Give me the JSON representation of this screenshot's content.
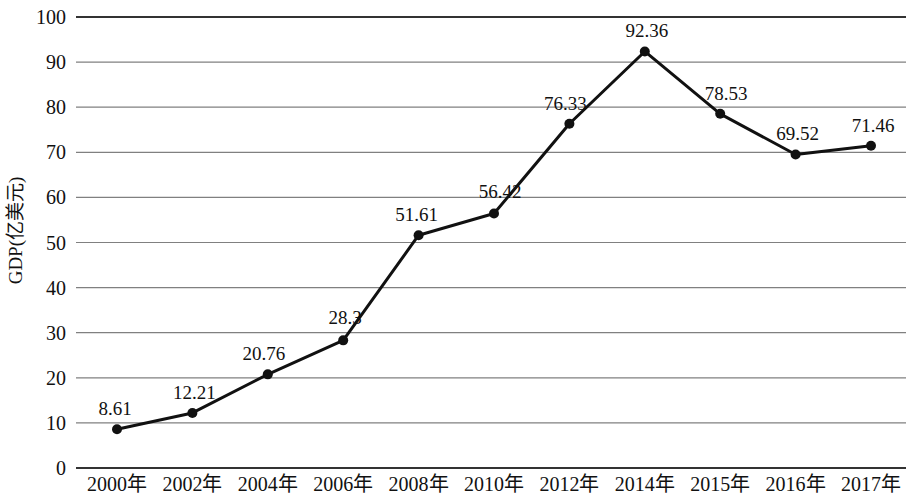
{
  "chart_data": {
    "type": "line",
    "title": "",
    "subtitle": "",
    "xlabel": "",
    "ylabel": "GDP(亿美元)",
    "categories": [
      "2000年",
      "2002年",
      "2004年",
      "2006年",
      "2008年",
      "2010年",
      "2012年",
      "2014年",
      "2015年",
      "2016年",
      "2017年"
    ],
    "values": [
      8.61,
      12.21,
      20.76,
      28.3,
      51.61,
      56.42,
      76.33,
      92.36,
      78.53,
      69.52,
      71.46
    ],
    "data_labels": [
      "8.61",
      "12.21",
      "20.76",
      "28.3",
      "51.61",
      "56.42",
      "76.33",
      "92.36",
      "78.53",
      "69.52",
      "71.46"
    ],
    "ylim": [
      0,
      100
    ],
    "y_ticks": [
      0,
      10,
      20,
      30,
      40,
      50,
      60,
      70,
      80,
      90,
      100
    ],
    "y_tick_labels": [
      "0",
      "10",
      "20",
      "30",
      "40",
      "50",
      "60",
      "70",
      "80",
      "90",
      "100"
    ],
    "grid": true,
    "grid_axis": "y",
    "legend": false,
    "legend_position": "none",
    "marker": "filled-circle",
    "line_color": "#111111",
    "marker_color": "#111111",
    "grid_color": "#808080",
    "background_color": "#ffffff"
  }
}
